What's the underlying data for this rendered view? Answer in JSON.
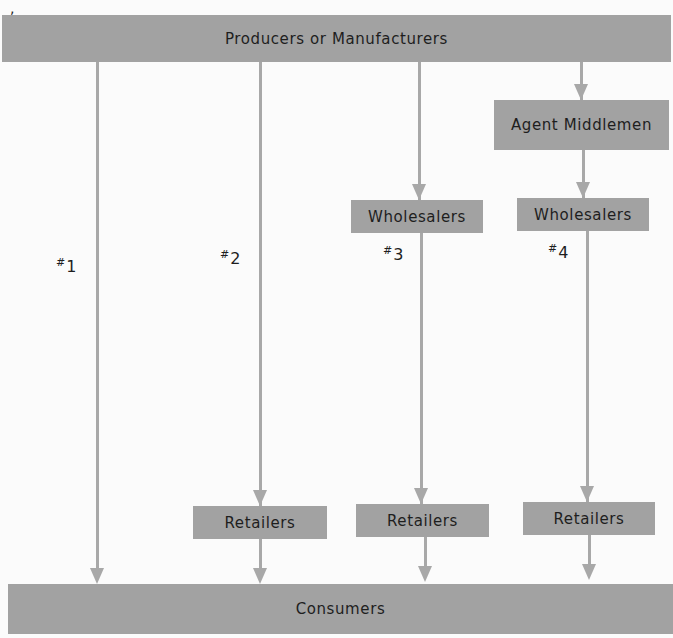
{
  "diagram": {
    "type": "distribution-channels",
    "top_node": "Producers or Manufacturers",
    "bottom_node": "Consumers",
    "channels": [
      {
        "id": "#1",
        "number": "1",
        "path": [
          "Producers or Manufacturers",
          "Consumers"
        ]
      },
      {
        "id": "#2",
        "number": "2",
        "path": [
          "Producers or Manufacturers",
          "Retailers",
          "Consumers"
        ]
      },
      {
        "id": "#3",
        "number": "3",
        "path": [
          "Producers or Manufacturers",
          "Wholesalers",
          "Retailers",
          "Consumers"
        ]
      },
      {
        "id": "#4",
        "number": "4",
        "path": [
          "Producers or Manufacturers",
          "Agent Middlemen",
          "Wholesalers",
          "Retailers",
          "Consumers"
        ]
      }
    ]
  },
  "nodes": {
    "producers": "Producers or Manufacturers",
    "consumers": "Consumers",
    "agent_middlemen": "Agent Middlemen",
    "wholesalers_3": "Wholesalers",
    "wholesalers_4": "Wholesalers",
    "retailers_2": "Retailers",
    "retailers_3": "Retailers",
    "retailers_4": "Retailers"
  },
  "labels": {
    "hash": "#",
    "c1": "1",
    "c2": "2",
    "c3": "3",
    "c4": "4"
  },
  "colors": {
    "box": "#a2a2a2",
    "arrow": "#a8a8a8",
    "background": "#fbfbfb",
    "text": "#1e1e1e"
  }
}
